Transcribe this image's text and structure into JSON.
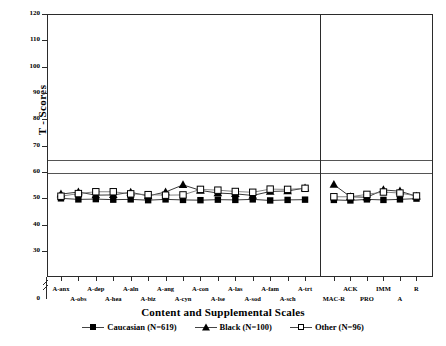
{
  "chart_data": {
    "type": "line",
    "title": "",
    "xlabel": "Content and Supplemental Scales",
    "ylabel": "T - Scores",
    "ylim": [
      0,
      120
    ],
    "yticks": [
      0,
      30,
      40,
      50,
      60,
      70,
      80,
      90,
      100,
      110,
      120
    ],
    "ytick_labels": [
      "0",
      "30",
      "40",
      "50",
      "60",
      "70",
      "80",
      "90",
      "100",
      "110",
      "120"
    ],
    "axis_break": true,
    "axis_break_between": [
      0,
      30
    ],
    "grid": false,
    "reference_lines": [
      65,
      60
    ],
    "legend_position": "bottom",
    "panel_divider_after_category": "A-trt",
    "categories": [
      "A-anx",
      "A-obs",
      "A-dep",
      "A-hea",
      "A-aln",
      "A-biz",
      "A-ang",
      "A-cyn",
      "A-con",
      "A-lse",
      "A-las",
      "A-sod",
      "A-fam",
      "A-sch",
      "A-trt",
      "MAC-R",
      "ACK",
      "PRO",
      "IMM",
      "A",
      "R"
    ],
    "series": [
      {
        "name": "Caucasian (N=619)",
        "n": 619,
        "marker": "filled-square",
        "color": "#000000",
        "values": [
          50.0,
          49.6,
          49.7,
          49.5,
          49.6,
          49.3,
          49.6,
          49.4,
          49.3,
          49.5,
          49.4,
          49.6,
          49.2,
          49.4,
          49.5,
          49.4,
          49.2,
          49.6,
          49.4,
          49.6,
          49.9
        ]
      },
      {
        "name": "Black (N=100)",
        "n": 100,
        "marker": "filled-triangle",
        "color": "#000000",
        "values": [
          51.6,
          52.4,
          51.2,
          51.3,
          52.3,
          50.9,
          52.4,
          55.1,
          53.0,
          52.0,
          51.7,
          51.1,
          52.6,
          52.8,
          53.9,
          55.2,
          50.6,
          50.4,
          53.2,
          52.7,
          50.8
        ]
      },
      {
        "name": "Other (N=96)",
        "n": 96,
        "marker": "open-square",
        "color": "#000000",
        "values": [
          50.8,
          51.8,
          52.5,
          52.5,
          51.7,
          51.4,
          51.2,
          51.3,
          53.4,
          53.1,
          52.6,
          52.3,
          53.5,
          53.4,
          53.8,
          50.6,
          50.6,
          51.5,
          52.4,
          52.0,
          50.9
        ]
      }
    ]
  },
  "axis": {
    "y_title": "T - Scores",
    "x_title": "Content and Supplemental Scales"
  },
  "legend": {
    "items": [
      {
        "label": "Caucasian (N=619)",
        "marker": "filled-square"
      },
      {
        "label": "Black (N=100)",
        "marker": "filled-triangle"
      },
      {
        "label": "Other (N=96)",
        "marker": "open-square"
      }
    ]
  }
}
